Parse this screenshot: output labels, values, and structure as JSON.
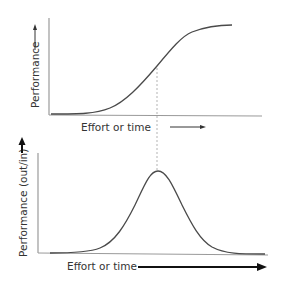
{
  "diagram": {
    "top_chart": {
      "y_label": "Performance",
      "x_label": "Effort or time",
      "curve_type": "s-curve"
    },
    "bottom_chart": {
      "y_label": "Performance (out/in)",
      "x_label": "Effort or time",
      "curve_type": "bell-curve"
    },
    "connector": "dashed vertical line linking the S-curve inflection point to the bell-curve peak"
  },
  "colors": {
    "axis": "#9a9a9a",
    "curve": "#4a4a4a",
    "text": "#333333",
    "arrow": "#222222",
    "dashed": "#aaaaaa"
  }
}
